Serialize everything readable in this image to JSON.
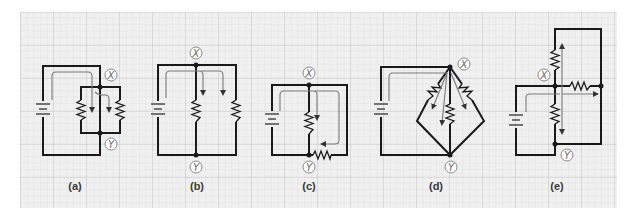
{
  "figure": {
    "background": "#f0f0f0",
    "grid_minor_color": "#dcdcdc",
    "grid_major_color": "#c8c8c8",
    "wire_color": "#1a1a1a",
    "flow_arrow_color": "#7a7a7a"
  },
  "panels": [
    {
      "id": "a",
      "label": "(a)",
      "node_x": "X",
      "node_y": "Y",
      "description": "battery with two resistors in parallel between X and Y, current splits at X"
    },
    {
      "id": "b",
      "label": "(b)",
      "node_x": "X",
      "node_y": "Y",
      "description": "battery in parallel with two resistors, X on top and Y on bottom"
    },
    {
      "id": "c",
      "label": "(c)",
      "node_x": "X",
      "node_y": "Y",
      "description": "one resistor between X and Y and a second resistor on the bottom-right branch"
    },
    {
      "id": "d",
      "label": "(d)",
      "node_x": "X",
      "node_y": "Y",
      "description": "three resistors fanning out from X in a diamond converging at Y"
    },
    {
      "id": "e",
      "label": "(e)",
      "node_x": "X",
      "node_y": "Y",
      "description": "resistors above, right of, and below node X, current branching three ways"
    }
  ]
}
